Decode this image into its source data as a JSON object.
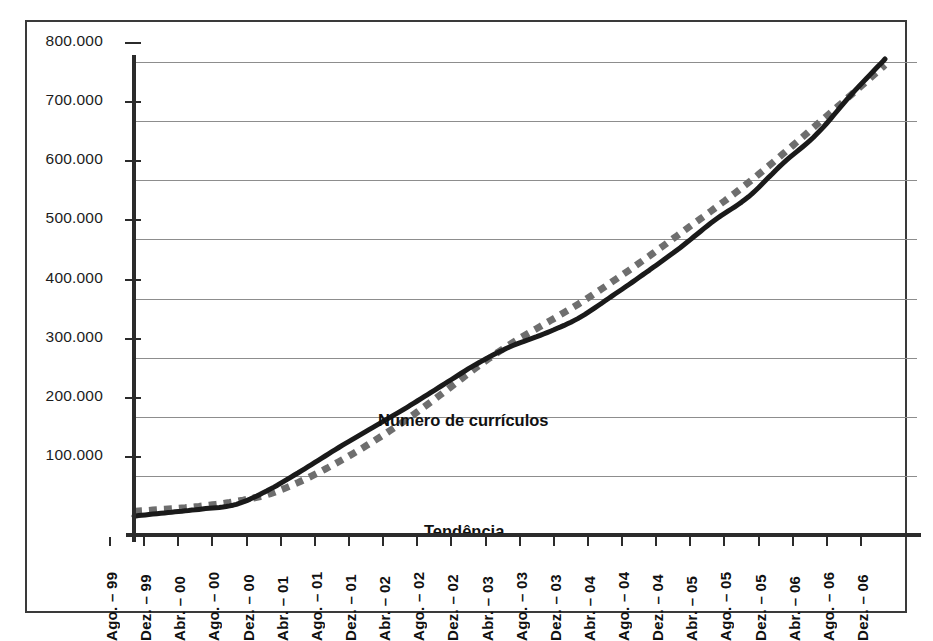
{
  "chart_data": {
    "type": "line",
    "title": "",
    "xlabel": "",
    "ylabel": "",
    "ylim": [
      0,
      800000
    ],
    "yticks": [
      100000,
      200000,
      300000,
      400000,
      500000,
      600000,
      700000,
      800000
    ],
    "ytick_labels": [
      "100.000",
      "200.000",
      "300.000",
      "400.000",
      "500.000",
      "600.000",
      "700.000",
      "800.000"
    ],
    "grid": true,
    "legend_position": "inline-annotation",
    "annotations": [
      {
        "text": "Número de currículos",
        "series": "Número de currículos"
      },
      {
        "text": "Tendência",
        "series": "Tendência"
      }
    ],
    "categories": [
      "Ago. – 99",
      "Dez. – 99",
      "Abr. – 00",
      "Ago. – 00",
      "Dez. – 00",
      "Abr. – 01",
      "Ago. – 01",
      "Dez. – 01",
      "Abr. – 02",
      "Ago. – 02",
      "Dez. – 02",
      "Abr. – 03",
      "Ago. – 03",
      "Dez. – 03",
      "Abr. – 04",
      "Ago. – 04",
      "Dez. – 04",
      "Abr. – 05",
      "Ago. – 05",
      "Dez. – 05",
      "Abr. – 06",
      "Ago. – 06",
      "Dez. – 06"
    ],
    "series": [
      {
        "name": "Número de currículos",
        "style": "solid",
        "color": "#1a1a1a",
        "values": [
          32000,
          38000,
          44000,
          52000,
          78000,
          112000,
          148000,
          182000,
          216000,
          252000,
          288000,
          318000,
          340000,
          366000,
          404000,
          444000,
          486000,
          532000,
          572000,
          628000,
          678000,
          744000,
          805000
        ]
      },
      {
        "name": "Tendência",
        "style": "dotted",
        "color": "#6e6e6e",
        "values": [
          40000,
          44000,
          49000,
          57000,
          70000,
          94000,
          124000,
          158000,
          196000,
          238000,
          282000,
          322000,
          356000,
          390000,
          428000,
          468000,
          510000,
          552000,
          596000,
          644000,
          694000,
          744000,
          795000
        ]
      }
    ]
  },
  "axis": {
    "x_first_label": "Ago. – 99",
    "x_last_label": "Dez. – 06",
    "y_max_label": "800.000",
    "y_min_label": "100.000"
  },
  "colors": {
    "series_line": "#1a1a1a",
    "trend_line": "#6e6e6e",
    "gridline": "#8d8d8d",
    "axis": "#2b2b2b",
    "frame": "#3a3a3a",
    "text": "#111111",
    "background": "#ffffff"
  }
}
